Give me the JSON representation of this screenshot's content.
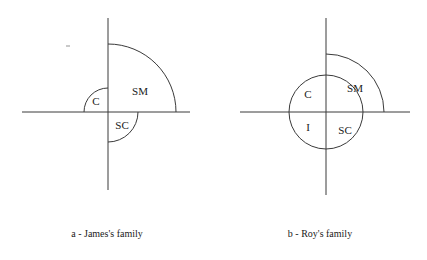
{
  "figure": {
    "background_color": "#ffffff",
    "stroke_color": "#3a3a3a",
    "text_color": "#1a1a1a",
    "diagrams": [
      {
        "id": "diagram-a",
        "caption": "a - James's family",
        "center": {
          "x": 108,
          "y": 112
        },
        "vertical_axis": {
          "x": 108,
          "y_top": 18,
          "y_bottom": 190
        },
        "horizontal_axis": {
          "y": 112,
          "x_left": 22,
          "x_right": 190
        },
        "regions": [
          {
            "key": "C",
            "label": "C",
            "quadrant": "upper-left",
            "radius": 24,
            "label_x": 96,
            "label_y": 102
          },
          {
            "key": "SM",
            "label": "SM",
            "quadrant": "upper-right",
            "radius": 68,
            "label_x": 140,
            "label_y": 92
          },
          {
            "key": "SC",
            "label": "SC",
            "quadrant": "lower-right",
            "radius": 30,
            "label_x": 122,
            "label_y": 126
          }
        ]
      },
      {
        "id": "diagram-b",
        "caption": "b - Roy's family",
        "center": {
          "x": 326,
          "y": 112
        },
        "vertical_axis": {
          "x": 326,
          "y_top": 18,
          "y_bottom": 195
        },
        "horizontal_axis": {
          "y": 112,
          "x_left": 240,
          "x_right": 410
        },
        "circle_radius": 37,
        "regions": [
          {
            "key": "C",
            "label": "C",
            "quadrant": "upper-left",
            "radius": 37,
            "label_x": 308,
            "label_y": 95
          },
          {
            "key": "SM",
            "label": "SM",
            "quadrant": "upper-right",
            "radius": 58,
            "label_x": 355,
            "label_y": 89
          },
          {
            "key": "I",
            "label": "I",
            "quadrant": "lower-left",
            "radius": 37,
            "label_x": 308,
            "label_y": 128
          },
          {
            "key": "SC",
            "label": "SC",
            "quadrant": "lower-right",
            "radius": 37,
            "label_x": 345,
            "label_y": 131
          }
        ]
      }
    ]
  }
}
